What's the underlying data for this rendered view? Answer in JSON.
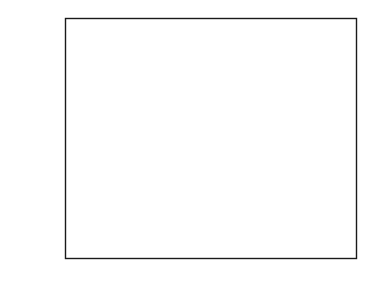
{
  "figure": {
    "width": 376,
    "height": 287,
    "background": "#ffffff",
    "frame_color": "#1a1a1a"
  },
  "chart_data": {
    "type": "scatter",
    "title_lines": [
      "Carbon dioxide mixing ratio from three",
      "cores at Law Dome, Antarctica"
    ],
    "xlabel": "",
    "ylabel": "CO2 mixing ratio (ppm)",
    "ylabel_prefix": "CO",
    "ylabel_subscript": "2",
    "ylabel_suffix": " mixing ratio (ppm)",
    "xlim": [
      1000,
      2000
    ],
    "ylim": [
      270,
      350
    ],
    "xticks": [
      1000,
      1250,
      1500,
      1750,
      2000
    ],
    "xtick_labels": [
      "1000",
      "1250",
      "1500",
      "1750",
      "2000"
    ],
    "xticks_minor": [
      1125,
      1375,
      1625,
      1875
    ],
    "yticks": [
      270,
      290,
      310,
      330,
      350
    ],
    "ytick_labels": [
      "270",
      "290",
      "310",
      "330",
      "350"
    ],
    "yticks_minor": [
      280,
      300,
      320,
      340
    ],
    "grid": false,
    "legend": false,
    "tick_direction": "in",
    "marker_colors": {
      "ice_core_dark": "#3a3a3a",
      "ice_core_mid": "#555555",
      "ice_core_light": "#8c8c8c",
      "direct_air": "#111111"
    },
    "series": [
      {
        "name": "Ice core CO2 (Law Dome DE08, DE08-2, DSS)",
        "marker": "diamond",
        "color": "#3a3a3a",
        "points": [
          [
            1006,
            279.3
          ],
          [
            1046,
            280.0
          ],
          [
            1096,
            281.8
          ],
          [
            1141,
            282.8
          ],
          [
            1194,
            282.9
          ],
          [
            1249,
            281.8
          ],
          [
            1327,
            282.7
          ],
          [
            1381,
            280.1
          ],
          [
            1449,
            279.6
          ],
          [
            1464,
            280.5
          ],
          [
            1499,
            281.7
          ],
          [
            1523,
            282.2
          ],
          [
            1533,
            282.5
          ],
          [
            1551,
            282.0
          ],
          [
            1562,
            281.9
          ],
          [
            1582,
            281.5
          ],
          [
            1597,
            279.2
          ],
          [
            1610,
            274.9
          ],
          [
            1639,
            277.2
          ],
          [
            1666,
            276.8
          ],
          [
            1684,
            276.1
          ],
          [
            1700,
            276.2
          ],
          [
            1713,
            277.0
          ],
          [
            1728,
            276.5
          ],
          [
            1746,
            276.6
          ],
          [
            1756,
            276.4
          ],
          [
            1763,
            278.2
          ],
          [
            1776,
            279.3
          ],
          [
            1790,
            281.3
          ],
          [
            1799,
            282.5
          ],
          [
            1804,
            283.1
          ],
          [
            1813,
            283.8
          ],
          [
            1820,
            284.0
          ],
          [
            1826,
            283.4
          ],
          [
            1834,
            282.5
          ],
          [
            1841,
            283.5
          ],
          [
            1846,
            284.2
          ],
          [
            1852,
            284.9
          ],
          [
            1858,
            285.3
          ],
          [
            1864,
            285.7
          ],
          [
            1870,
            287.1
          ],
          [
            1876,
            287.6
          ],
          [
            1881,
            288.8
          ],
          [
            1888,
            289.9
          ],
          [
            1894,
            292.0
          ],
          [
            1898,
            294.0
          ],
          [
            1901,
            295.4
          ],
          [
            1905,
            296.6
          ],
          [
            1909,
            298.1
          ],
          [
            1912,
            299.6
          ],
          [
            1915,
            300.6
          ],
          [
            1919,
            301.7
          ],
          [
            1922,
            303.6
          ],
          [
            1925,
            304.6
          ],
          [
            1928,
            306.1
          ],
          [
            1931,
            306.8
          ],
          [
            1934,
            307.9
          ],
          [
            1937,
            308.6
          ],
          [
            1940,
            309.9
          ],
          [
            1943,
            310.5
          ],
          [
            1946,
            310.8
          ],
          [
            1949,
            311.2
          ],
          [
            1952,
            311.9
          ],
          [
            1955,
            312.8
          ],
          [
            1958,
            314.4
          ],
          [
            1961,
            315.6
          ],
          [
            1964,
            317.2
          ],
          [
            1967,
            318.9
          ],
          [
            1970,
            320.0
          ],
          [
            1973,
            321.0
          ],
          [
            1976,
            321.8
          ]
        ]
      },
      {
        "name": "Ice core CO2 (overlap / second core)",
        "marker": "diamond",
        "color": "#8c8c8c",
        "points": [
          [
            1809,
            283.6
          ],
          [
            1830,
            282.8
          ],
          [
            1838,
            283.0
          ],
          [
            1867,
            285.2
          ],
          [
            1884,
            288.2
          ],
          [
            1903,
            295.8
          ],
          [
            1917,
            301.0
          ],
          [
            1930,
            306.4
          ],
          [
            1939,
            309.2
          ],
          [
            1947,
            310.6
          ],
          [
            1954,
            312.3
          ],
          [
            1960,
            314.9
          ],
          [
            1966,
            317.8
          ],
          [
            1972,
            320.4
          ]
        ]
      },
      {
        "name": "Direct atmospheric measurements (Cape Grim)",
        "marker": "square",
        "color": "#111111",
        "points": [
          [
            1969,
            325.9
          ],
          [
            1971,
            326.5
          ],
          [
            1973,
            328.5
          ],
          [
            1975,
            331.4
          ],
          [
            1977,
            335.9
          ]
        ]
      }
    ]
  },
  "annotations": {
    "top_value_ppm": "336",
    "preindustrial_mean_ppm": "280",
    "minimum_ppm": "275"
  }
}
